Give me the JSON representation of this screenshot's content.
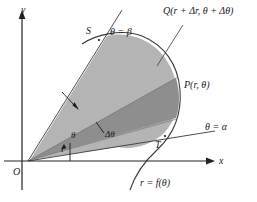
{
  "figure": {
    "colors": {
      "background": "#ffffff",
      "ink": "#1a1a1a",
      "region_light": "#b4b4b4",
      "region_dark": "#8e8e8e",
      "axis": "#222222",
      "curve": "#3a3a3a"
    }
  },
  "axes": {
    "x_label": "x",
    "y_label": "y",
    "origin_label": "O"
  },
  "labels": {
    "point_s": "S",
    "point_t": "T",
    "point_p": "P(r, θ)",
    "point_q": "Q(r + Δr, θ + Δθ)",
    "ray_beta": "θ = β",
    "ray_alpha": "θ = α",
    "curve": "r = f(θ)",
    "angle_theta": "θ",
    "angle_delta_theta": "Δθ"
  }
}
